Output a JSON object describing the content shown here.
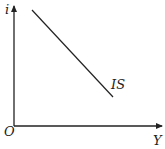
{
  "diagram": {
    "y_axis_label": "i",
    "x_axis_label": "Y",
    "origin_label": "O",
    "curve_label": "IS",
    "curve_slope": "downward-sloping",
    "colors": {
      "line": "#222222",
      "background": "#ffffff"
    }
  }
}
